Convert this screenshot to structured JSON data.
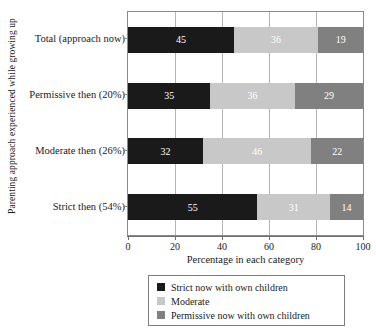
{
  "chart_data": {
    "type": "bar",
    "orientation": "horizontal",
    "stacked": true,
    "title": "",
    "xlabel": "Percentage in each category",
    "ylabel": "Parenting approach experienced while growing up",
    "xlim": [
      0,
      100
    ],
    "xticks": [
      0,
      20,
      40,
      60,
      80,
      100
    ],
    "grid": true,
    "legend_position": "bottom",
    "categories": [
      "Total (approach now)",
      "Permissive then (20%)",
      "Moderate then (26%)",
      "Strict then (54%)"
    ],
    "series": [
      {
        "name": "Strict now with own children",
        "color": "#1a1a1a",
        "values": [
          45,
          35,
          32,
          55
        ]
      },
      {
        "name": "Moderate",
        "color": "#c8c8c8",
        "values": [
          36,
          36,
          46,
          31
        ]
      },
      {
        "name": "Permissive now with own children",
        "color": "#808080",
        "values": [
          19,
          29,
          22,
          14
        ]
      }
    ]
  }
}
